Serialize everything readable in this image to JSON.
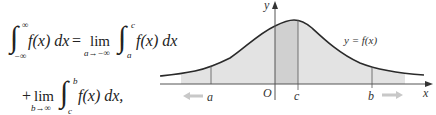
{
  "formula": {
    "line1": {
      "lhs_integral": "∫",
      "lhs_lower": "−∞",
      "lhs_upper": "∞",
      "lhs_integrand": "f(x) dx",
      "equals": "=",
      "lim": "lim",
      "lim_sub": "a→−∞",
      "rhs_integral": "∫",
      "rhs_lower": "a",
      "rhs_upper": "c",
      "rhs_integrand": "f(x) dx"
    },
    "line2": {
      "plus": "+",
      "lim": "lim",
      "lim_sub": "b→∞",
      "integral": "∫",
      "lower": "c",
      "upper": "b",
      "integrand": "f(x) dx,"
    }
  },
  "graph": {
    "curve_label": "y = f(x)",
    "x_axis_label": "x",
    "y_axis_label": "y",
    "origin_label": "O",
    "points": [
      "a",
      "c",
      "b"
    ],
    "colors": {
      "curve": "#2a2a2a",
      "shade_light": "#e3e3e3",
      "shade_dark": "#d2d2d2",
      "arrow": "#c8c8c8",
      "axis": "#555555"
    }
  }
}
